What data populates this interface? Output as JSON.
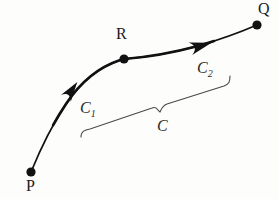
{
  "figure": {
    "type": "geometry-diagram",
    "background_color": "#fdfdfc",
    "stroke_color": "#111111",
    "brace_color": "#4a4a4a",
    "points": [
      {
        "id": "P",
        "label": "P",
        "x": 31,
        "y": 172,
        "label_x": 26,
        "label_y": 178
      },
      {
        "id": "R",
        "label": "R",
        "x": 124,
        "y": 59,
        "label_x": 116,
        "label_y": 26
      },
      {
        "id": "Q",
        "label": "Q",
        "x": 257,
        "y": 25,
        "label_x": 258,
        "label_y": 1
      }
    ],
    "segments": [
      {
        "id": "C1",
        "label": "C",
        "subscript": "1",
        "from": "P",
        "to": "R",
        "label_x": 80,
        "label_y": 100,
        "path": "M31,172 C40,150 50,128 66,104 C82,80 102,65 124,59",
        "stroke_width_start": 1.6,
        "stroke_width_end": 2.6,
        "arrow_x": 71,
        "arrow_y": 91,
        "arrow_angle": -55
      },
      {
        "id": "C2",
        "label": "C",
        "subscript": "2",
        "from": "R",
        "to": "Q",
        "label_x": 197,
        "label_y": 60,
        "path": "M124,59 C150,57 172,53 198,46 C222,39 243,31 257,25",
        "stroke_width_start": 2.6,
        "stroke_width_end": 1.6,
        "arrow_x": 198,
        "arrow_y": 46,
        "arrow_angle": -16
      }
    ],
    "brace": {
      "id": "C",
      "label": "C",
      "label_x": 157,
      "label_y": 118,
      "path": "M81,137 C81,131 85,130 90,129 L152,108 C157,106 157,110 160,112 C161,110 162,106 167,104 L224,86 C229,84 230,82 230,76",
      "left_x": 81,
      "left_y": 137,
      "right_x": 230,
      "right_y": 76,
      "mid_x": 160,
      "mid_y": 112
    }
  }
}
